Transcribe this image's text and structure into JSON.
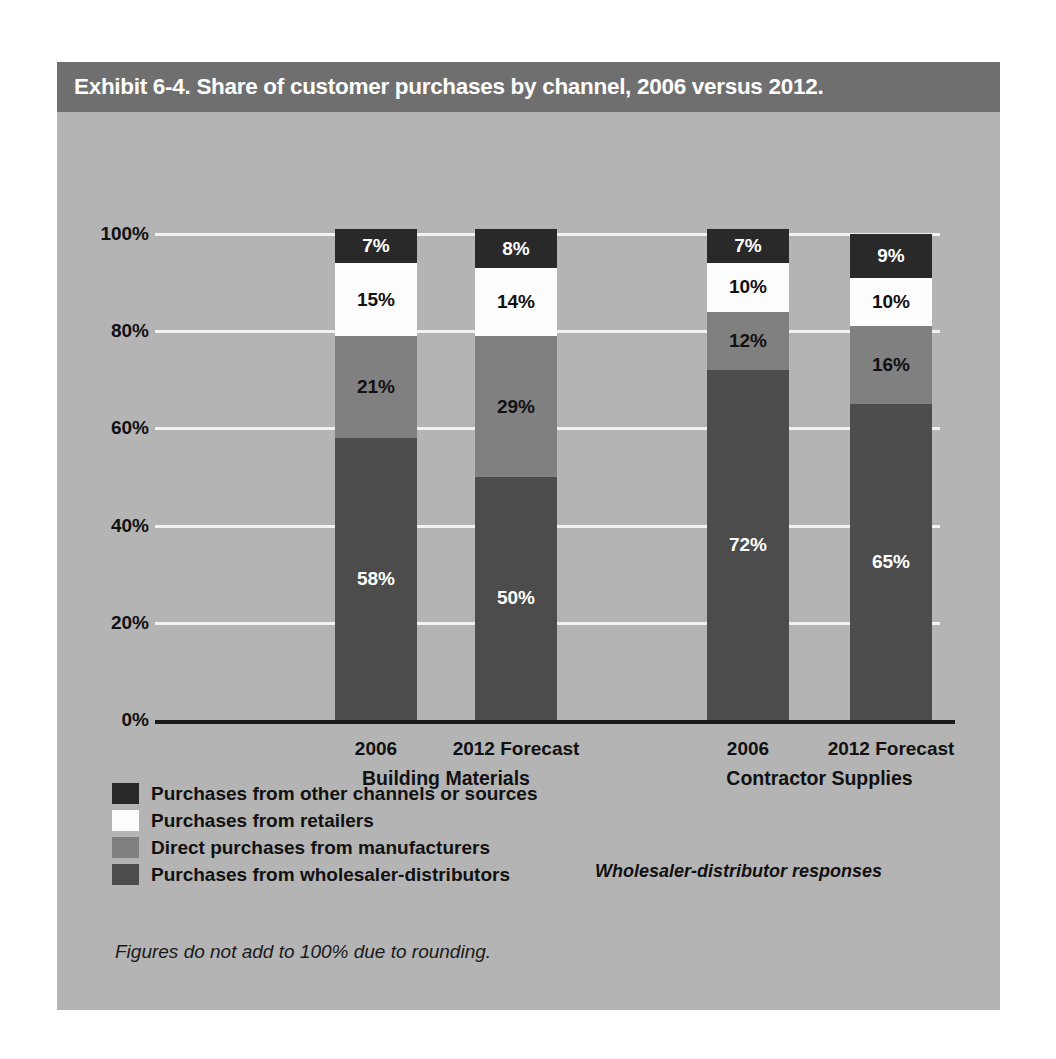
{
  "exhibit": {
    "title": "Exhibit 6-4. Share of customer purchases by channel, 2006 versus 2012.",
    "footnote": "Figures do not add to 100% due to rounding.",
    "responses_note": "Wholesaler-distributor responses"
  },
  "colors": {
    "panel_background": "#b4b4b4",
    "title_bar": "#6f6f6f",
    "title_text": "#ffffff",
    "gridline": "#f2f2f2",
    "axis_line": "#1a1a1a",
    "other_channels": "#292929",
    "retailers": "#fdfdfd",
    "direct_manufacturers": "#808080",
    "wholesaler_distributors": "#4c4c4c"
  },
  "chart_data": {
    "type": "bar",
    "subtype": "stacked-100-percent",
    "title": "Exhibit 6-4. Share of customer purchases by channel, 2006 versus 2012.",
    "xlabel": "",
    "ylabel": "",
    "ylim": [
      0,
      100
    ],
    "grid": true,
    "legend_position": "bottom-left",
    "ytick_labels": [
      "100%",
      "80%",
      "60%",
      "40%",
      "20%",
      "0%"
    ],
    "ytick_values": [
      100,
      80,
      60,
      40,
      20,
      0
    ],
    "groups": [
      {
        "name": "Building Materials",
        "categories": [
          "2006",
          "2012 Forecast"
        ]
      },
      {
        "name": "Contractor Supplies",
        "categories": [
          "2006",
          "2012 Forecast"
        ]
      }
    ],
    "categories": [
      "2006",
      "2012 Forecast",
      "2006",
      "2012 Forecast"
    ],
    "series": [
      {
        "name": "Purchases from wholesaler-distributors",
        "color": "#4c4c4c",
        "values": [
          58,
          50,
          72,
          65
        ],
        "labels": [
          "58%",
          "50%",
          "72%",
          "65%"
        ]
      },
      {
        "name": "Direct purchases from manufacturers",
        "color": "#808080",
        "values": [
          21,
          29,
          12,
          16
        ],
        "labels": [
          "21%",
          "29%",
          "12%",
          "16%"
        ]
      },
      {
        "name": "Purchases from retailers",
        "color": "#fdfdfd",
        "values": [
          15,
          14,
          10,
          10
        ],
        "labels": [
          "15%",
          "14%",
          "10%",
          "10%"
        ]
      },
      {
        "name": "Purchases from other channels or sources",
        "color": "#292929",
        "values": [
          7,
          8,
          7,
          9
        ],
        "labels": [
          "7%",
          "8%",
          "7%",
          "9%"
        ]
      }
    ],
    "bars": [
      {
        "group": "Building Materials",
        "category": "2006",
        "segments": [
          {
            "series": "Purchases from other channels or sources",
            "value": 7,
            "label": "7%"
          },
          {
            "series": "Purchases from retailers",
            "value": 15,
            "label": "15%"
          },
          {
            "series": "Direct purchases from manufacturers",
            "value": 21,
            "label": "21%"
          },
          {
            "series": "Purchases from wholesaler-distributors",
            "value": 58,
            "label": "58%"
          }
        ]
      },
      {
        "group": "Building Materials",
        "category": "2012 Forecast",
        "segments": [
          {
            "series": "Purchases from other channels or sources",
            "value": 8,
            "label": "8%"
          },
          {
            "series": "Purchases from retailers",
            "value": 14,
            "label": "14%"
          },
          {
            "series": "Direct purchases from manufacturers",
            "value": 29,
            "label": "29%"
          },
          {
            "series": "Purchases from wholesaler-distributors",
            "value": 50,
            "label": "50%"
          }
        ]
      },
      {
        "group": "Contractor Supplies",
        "category": "2006",
        "segments": [
          {
            "series": "Purchases from other channels or sources",
            "value": 7,
            "label": "7%"
          },
          {
            "series": "Purchases from retailers",
            "value": 10,
            "label": "10%"
          },
          {
            "series": "Direct purchases from manufacturers",
            "value": 12,
            "label": "12%"
          },
          {
            "series": "Purchases from wholesaler-distributors",
            "value": 72,
            "label": "72%"
          }
        ]
      },
      {
        "group": "Contractor Supplies",
        "category": "2012 Forecast",
        "segments": [
          {
            "series": "Purchases from other channels or sources",
            "value": 9,
            "label": "9%"
          },
          {
            "series": "Purchases from retailers",
            "value": 10,
            "label": "10%"
          },
          {
            "series": "Direct purchases from manufacturers",
            "value": 16,
            "label": "16%"
          },
          {
            "series": "Purchases from wholesaler-distributors",
            "value": 65,
            "label": "65%"
          }
        ]
      }
    ],
    "legend": [
      {
        "label": "Purchases from other channels or sources",
        "color": "#292929"
      },
      {
        "label": "Purchases from retailers",
        "color": "#fdfdfd"
      },
      {
        "label": "Direct purchases from manufacturers",
        "color": "#808080"
      },
      {
        "label": "Purchases from wholesaler-distributors",
        "color": "#4c4c4c"
      }
    ]
  }
}
